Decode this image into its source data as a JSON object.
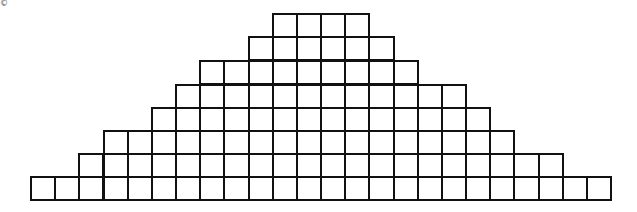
{
  "copyright_symbol": "©",
  "grid": {
    "origin_x": 31,
    "cell_width": 24.17,
    "cell_height": 23.4,
    "line_color": "#111111",
    "rows": [
      {
        "top": 14,
        "start_col": 10,
        "count": 4
      },
      {
        "top": 37,
        "start_col": 9,
        "count": 6
      },
      {
        "top": 61,
        "start_col": 7,
        "count": 9
      },
      {
        "top": 85,
        "start_col": 6,
        "count": 12
      },
      {
        "top": 108,
        "start_col": 5,
        "count": 14
      },
      {
        "top": 131,
        "start_col": 3,
        "count": 17
      },
      {
        "top": 154,
        "start_col": 2,
        "count": 20
      },
      {
        "top": 177,
        "start_col": 0,
        "count": 24
      }
    ]
  }
}
